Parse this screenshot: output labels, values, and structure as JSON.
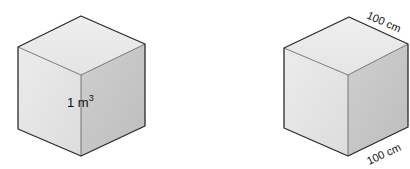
{
  "figure": {
    "left_cube": {
      "volume_label": "1 m",
      "volume_exponent": "3"
    },
    "right_cube": {
      "top_edge_label": "100 cm",
      "bottom_edge_label": "100 cm"
    },
    "colors": {
      "top_face": "#ebebeb",
      "left_face": "#e4e4e4",
      "right_face": "#c9c9c9",
      "edge": "#2a2a2a"
    }
  }
}
